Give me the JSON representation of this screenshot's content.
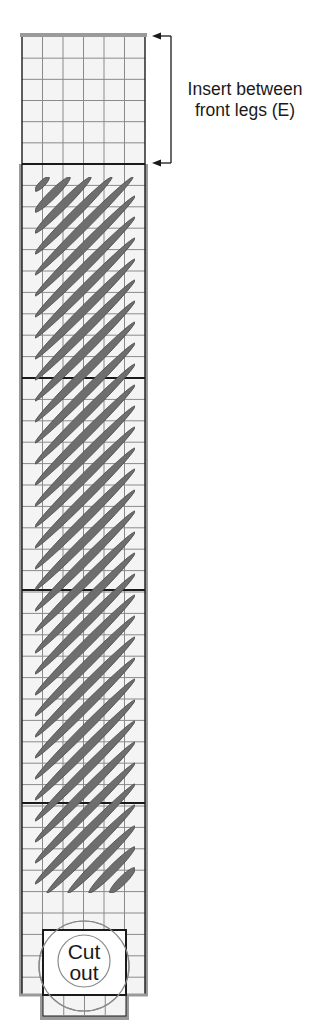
{
  "annotation": {
    "line1": "Insert between",
    "line2": "front legs (E)",
    "bracket": {
      "x": 171,
      "y_top": 36,
      "y_bottom": 163,
      "arrow_tip_x": 152
    }
  },
  "cutout": {
    "line1": "Cut",
    "line2": "out",
    "rect": {
      "x": 43,
      "y": 930,
      "w": 83,
      "h": 65
    },
    "big_circle": {
      "cx": 84,
      "cy": 966,
      "r": 45
    },
    "small_circle": {
      "cx": 84,
      "cy": 961,
      "r": 26
    }
  },
  "board": {
    "x_left": 22,
    "x_right": 145,
    "columns": 6,
    "top_y": 35,
    "upper_section_bottom_y": 164,
    "body_bottom_y": 995,
    "row_height": 21.4,
    "thick_divider_ys": [
      164,
      378,
      590,
      803
    ],
    "tab": {
      "x": 42,
      "y": 995,
      "w": 85,
      "h": 23,
      "columns": 4
    }
  },
  "stripes": {
    "clip": {
      "x0": 35,
      "y0": 177,
      "x1": 135,
      "y1": 893
    },
    "first_lower_left_y": 191,
    "spacing": 21,
    "count": 38,
    "diag_span": 100,
    "width": 8
  },
  "colors": {
    "grid_line": "#8a8a8a",
    "outline": "#1a1a1a",
    "border_band": "#9a9a9a",
    "cell_fill": "#f4f4f4",
    "stripe_fill": "#6e6e6e",
    "stripe_stroke": "#4a4a4a",
    "circle_stroke": "#8a8a8a"
  }
}
